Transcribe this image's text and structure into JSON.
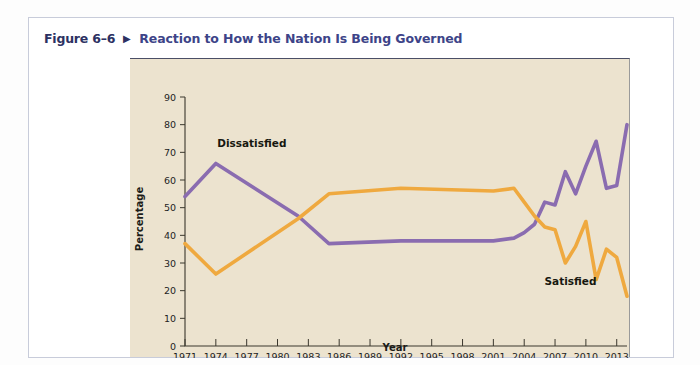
{
  "figure": {
    "number": "Figure 6–6",
    "arrow_icon": "triangle-right-icon",
    "arrow_glyph": "▶",
    "title": "Reaction to How the Nation Is Being Governed"
  },
  "colors": {
    "page_background": "#fdfdfd",
    "card_background": "#ffffff",
    "card_border": "#c8ccda",
    "panel_background": "#ece3cf",
    "figure_number_text": "#2c3162",
    "figure_title_text": "#3d4488",
    "axis": "#3b382e",
    "dissatisfied_line": "#8a6cb0",
    "satisfied_line": "#efa93f",
    "label_text": "#17170f"
  },
  "chart_data": {
    "type": "line",
    "title": "Reaction to How the Nation Is Being Governed",
    "xlabel": "Year",
    "ylabel": "Percentage",
    "xlim": [
      1971,
      2014
    ],
    "ylim": [
      0,
      90
    ],
    "ytick_step": 10,
    "yticks": [
      0,
      10,
      20,
      30,
      40,
      50,
      60,
      70,
      80,
      90
    ],
    "xticks": [
      1971,
      1974,
      1977,
      1980,
      1983,
      1986,
      1989,
      1992,
      1995,
      1998,
      2001,
      2004,
      2007,
      2010,
      2013
    ],
    "xtick_labels": [
      "1971",
      "1974",
      "1977",
      "1980",
      "1983",
      "1986",
      "1989",
      "1992",
      "1995",
      "1998",
      "2001",
      "2004",
      "2007",
      "2010",
      "2013"
    ],
    "grid": false,
    "legend": "inline-annotations",
    "annotations": [
      {
        "text": "Dissatisfied",
        "x": 1977.5,
        "y": 72,
        "series": "Dissatisfied"
      },
      {
        "text": "Satisfied",
        "x": 2008.5,
        "y": 22,
        "series": "Satisfied"
      }
    ],
    "series": [
      {
        "name": "Dissatisfied",
        "color": "#8a6cb0",
        "x": [
          1971,
          1974,
          1982,
          1985,
          1992,
          2001,
          2003,
          2004,
          2005,
          2006,
          2007,
          2008,
          2009,
          2010,
          2011,
          2012,
          2013,
          2014
        ],
        "values": [
          54,
          66,
          47,
          37,
          38,
          38,
          39,
          41,
          44,
          52,
          51,
          63,
          55,
          65,
          74,
          57,
          58,
          80
        ]
      },
      {
        "name": "Satisfied",
        "color": "#efa93f",
        "x": [
          1971,
          1974,
          1982,
          1985,
          1992,
          2001,
          2003,
          2004,
          2005,
          2006,
          2007,
          2008,
          2009,
          2010,
          2011,
          2012,
          2013,
          2014
        ],
        "values": [
          37,
          26,
          46,
          55,
          57,
          56,
          57,
          52,
          47,
          43,
          42,
          30,
          36,
          45,
          24,
          35,
          32,
          18
        ]
      }
    ]
  }
}
